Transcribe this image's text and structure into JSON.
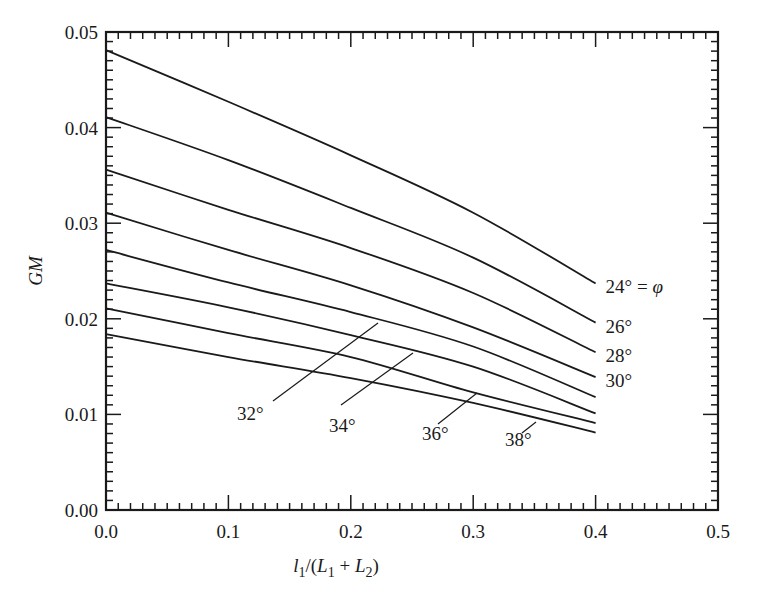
{
  "chart_data": {
    "type": "line",
    "title": "",
    "xlabel": "l1/(L1 + L2)",
    "ylabel": "GM",
    "xlim": [
      0.0,
      0.5
    ],
    "ylim": [
      0.0,
      0.05
    ],
    "grid": false,
    "legend": "inline labels at curve ends",
    "x_ticks": [
      "0.0",
      "0.1",
      "0.2",
      "0.3",
      "0.4",
      "0.5"
    ],
    "y_ticks": [
      "0.00",
      "0.01",
      "0.02",
      "0.03",
      "0.04",
      "0.05"
    ],
    "x": [
      0.0,
      0.1,
      0.2,
      0.3,
      0.4
    ],
    "series": [
      {
        "name": "24° = φ",
        "values": [
          0.0481,
          0.0427,
          0.0371,
          0.0311,
          0.0237
        ]
      },
      {
        "name": "26°",
        "values": [
          0.0411,
          0.0366,
          0.0316,
          0.0264,
          0.0196
        ]
      },
      {
        "name": "28°",
        "values": [
          0.0356,
          0.0314,
          0.0274,
          0.0227,
          0.0165
        ]
      },
      {
        "name": "30°",
        "values": [
          0.0311,
          0.0272,
          0.0235,
          0.0191,
          0.0139
        ]
      },
      {
        "name": "32°",
        "values": [
          0.0272,
          0.0238,
          0.0207,
          0.0171,
          0.0118
        ]
      },
      {
        "name": "34°",
        "values": [
          0.0237,
          0.0212,
          0.0183,
          0.015,
          0.0101
        ]
      },
      {
        "name": "36°",
        "values": [
          0.0211,
          0.0185,
          0.016,
          0.0123,
          0.0091
        ]
      },
      {
        "name": "38°",
        "values": [
          0.0184,
          0.016,
          0.0138,
          0.0112,
          0.0081
        ]
      }
    ],
    "labels": {
      "end_labels": [
        {
          "text": "24° = φ",
          "series": 0
        },
        {
          "text": "26°",
          "series": 1
        },
        {
          "text": "28°",
          "series": 2
        },
        {
          "text": "30°",
          "series": 3
        }
      ],
      "leader_labels": [
        {
          "text": "32°",
          "series": 4,
          "tx": 237,
          "ty": 420,
          "x1": 273,
          "y1": 401,
          "x2": 378,
          "y2": 323
        },
        {
          "text": "34°",
          "series": 5,
          "tx": 329,
          "ty": 432,
          "x1": 341,
          "y1": 405,
          "x2": 413,
          "y2": 353
        },
        {
          "text": "36°",
          "series": 6,
          "tx": 422,
          "ty": 440,
          "x1": 438,
          "y1": 424,
          "x2": 477,
          "y2": 393
        },
        {
          "text": "38°",
          "series": 7,
          "tx": 505,
          "ty": 446,
          "x1": 522,
          "y1": 433,
          "x2": 536,
          "y2": 422
        }
      ]
    }
  },
  "colors": {
    "ink": "#1a1a1a",
    "background": "#ffffff"
  }
}
